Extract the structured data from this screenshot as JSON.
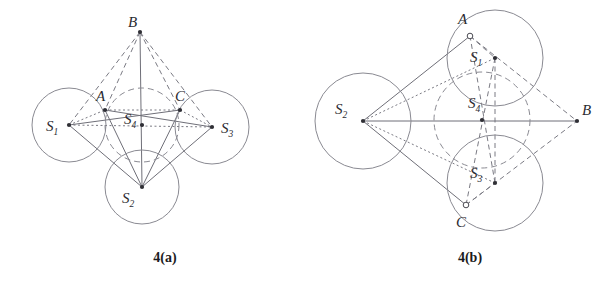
{
  "document": {
    "type": "geometry-figure-pair",
    "background_color": "#ffffff",
    "line_color": "#8a8a92",
    "label_color": "#2b2b31"
  },
  "figures": [
    {
      "id": "fig-4a",
      "caption": "4(a)",
      "caption_x": 165,
      "caption_y": 262,
      "circles": [
        {
          "name": "circle-s1",
          "label": "S",
          "sub": "1",
          "cx": 69,
          "cy": 125,
          "r": 37,
          "style": "solid",
          "label_x": 46,
          "label_y": 131,
          "dot": true
        },
        {
          "name": "circle-s2",
          "label": "S",
          "sub": "2",
          "cx": 142,
          "cy": 187,
          "r": 37,
          "style": "solid",
          "label_x": 122,
          "label_y": 203,
          "dot": true
        },
        {
          "name": "circle-s3",
          "label": "S",
          "sub": "3",
          "cx": 212,
          "cy": 127,
          "r": 37,
          "style": "solid",
          "label_x": 221,
          "label_y": 133,
          "dot": true
        },
        {
          "name": "circle-s4",
          "label": "S",
          "sub": "4",
          "cx": 142,
          "cy": 125,
          "r": 37,
          "style": "dashed",
          "label_x": 124,
          "label_y": 124,
          "dot": true
        }
      ],
      "points": [
        {
          "name": "point-a",
          "label": "A",
          "x": 105,
          "y": 110,
          "label_x": 96,
          "label_y": 101,
          "marker": "dot"
        },
        {
          "name": "point-b",
          "label": "B",
          "x": 140,
          "y": 32,
          "label_x": 128,
          "label_y": 27,
          "marker": "dot"
        },
        {
          "name": "point-c",
          "label": "C",
          "x": 180,
          "y": 110,
          "label_x": 175,
          "label_y": 101,
          "marker": "dot"
        }
      ],
      "edges_solid": [
        {
          "name": "edge-s1-c",
          "x1": 69,
          "y1": 125,
          "x2": 180,
          "y2": 110
        },
        {
          "name": "edge-s1-s2",
          "x1": 69,
          "y1": 125,
          "x2": 142,
          "y2": 187
        },
        {
          "name": "edge-s3-a",
          "x1": 212,
          "y1": 127,
          "x2": 105,
          "y2": 110
        },
        {
          "name": "edge-s3-s2",
          "x1": 212,
          "y1": 127,
          "x2": 142,
          "y2": 187
        },
        {
          "name": "edge-s2-a",
          "x1": 142,
          "y1": 187,
          "x2": 105,
          "y2": 110
        },
        {
          "name": "edge-s2-c",
          "x1": 142,
          "y1": 187,
          "x2": 180,
          "y2": 110
        },
        {
          "name": "edge-s2-b",
          "x1": 142,
          "y1": 187,
          "x2": 140,
          "y2": 32
        }
      ],
      "edges_dashed": [
        {
          "name": "edge-b-a",
          "x1": 140,
          "y1": 32,
          "x2": 105,
          "y2": 110
        },
        {
          "name": "edge-b-c",
          "x1": 140,
          "y1": 32,
          "x2": 180,
          "y2": 110
        },
        {
          "name": "edge-b-s1",
          "x1": 140,
          "y1": 32,
          "x2": 69,
          "y2": 125
        },
        {
          "name": "edge-b-s3",
          "x1": 140,
          "y1": 32,
          "x2": 212,
          "y2": 127
        }
      ],
      "edges_dotted": [
        {
          "name": "edge-s1-s3-axis",
          "x1": 69,
          "y1": 125,
          "x2": 212,
          "y2": 127
        },
        {
          "name": "edge-s1-a",
          "x1": 69,
          "y1": 125,
          "x2": 105,
          "y2": 110
        },
        {
          "name": "edge-a-c",
          "x1": 105,
          "y1": 110,
          "x2": 180,
          "y2": 110
        },
        {
          "name": "edge-c-s3",
          "x1": 180,
          "y1": 110,
          "x2": 212,
          "y2": 127
        }
      ]
    },
    {
      "id": "fig-4b",
      "caption": "4(b)",
      "caption_x": 470,
      "caption_y": 262,
      "circles": [
        {
          "name": "circle-s2",
          "label": "S",
          "sub": "2",
          "cx": 363,
          "cy": 121,
          "r": 48,
          "style": "solid",
          "label_x": 335,
          "label_y": 114,
          "dot": true
        },
        {
          "name": "circle-s1",
          "label": "S",
          "sub": "1",
          "cx": 495,
          "cy": 58,
          "r": 48,
          "style": "solid",
          "label_x": 470,
          "label_y": 62,
          "dot": true
        },
        {
          "name": "circle-s3",
          "label": "S",
          "sub": "3",
          "cx": 495,
          "cy": 183,
          "r": 48,
          "style": "solid",
          "label_x": 470,
          "label_y": 178,
          "dot": true
        },
        {
          "name": "circle-s4",
          "label": "S",
          "sub": "4",
          "cx": 482,
          "cy": 120,
          "r": 48,
          "style": "dashed",
          "label_x": 468,
          "label_y": 108,
          "dot": true
        }
      ],
      "points": [
        {
          "name": "point-a",
          "label": "A",
          "x": 470,
          "y": 36,
          "label_x": 458,
          "label_y": 24,
          "marker": "ring"
        },
        {
          "name": "point-b",
          "label": "B",
          "x": 577,
          "y": 121,
          "label_x": 582,
          "label_y": 115,
          "marker": "dot"
        },
        {
          "name": "point-c",
          "label": "C",
          "x": 466,
          "y": 205,
          "label_x": 456,
          "label_y": 227,
          "marker": "ring"
        }
      ],
      "edges_solid": [
        {
          "name": "edge-s2-a",
          "x1": 363,
          "y1": 121,
          "x2": 470,
          "y2": 36
        },
        {
          "name": "edge-s2-c",
          "x1": 363,
          "y1": 121,
          "x2": 466,
          "y2": 205
        },
        {
          "name": "edge-s2-b",
          "x1": 363,
          "y1": 121,
          "x2": 577,
          "y2": 121
        }
      ],
      "edges_dashed": [
        {
          "name": "edge-a-b",
          "x1": 470,
          "y1": 36,
          "x2": 577,
          "y2": 121
        },
        {
          "name": "edge-c-b",
          "x1": 466,
          "y1": 205,
          "x2": 577,
          "y2": 121
        },
        {
          "name": "edge-a-s1",
          "x1": 470,
          "y1": 36,
          "x2": 495,
          "y2": 58
        },
        {
          "name": "edge-c-s3",
          "x1": 466,
          "y1": 205,
          "x2": 495,
          "y2": 183
        },
        {
          "name": "edge-s1-s3",
          "x1": 495,
          "y1": 58,
          "x2": 495,
          "y2": 183
        },
        {
          "name": "edge-s1-c",
          "x1": 495,
          "y1": 58,
          "x2": 466,
          "y2": 205
        },
        {
          "name": "edge-s3-a",
          "x1": 495,
          "y1": 183,
          "x2": 470,
          "y2": 36
        }
      ],
      "edges_dotted": [
        {
          "name": "edge-s2-s1",
          "x1": 363,
          "y1": 121,
          "x2": 495,
          "y2": 58
        },
        {
          "name": "edge-s2-s3",
          "x1": 363,
          "y1": 121,
          "x2": 495,
          "y2": 183
        }
      ]
    }
  ]
}
